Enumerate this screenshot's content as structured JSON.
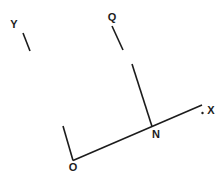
{
  "diagram": {
    "canvas": {
      "width": 223,
      "height": 184,
      "background": "#ffffff"
    },
    "stroke": {
      "color": "#1c1c1c",
      "width": 1.6
    },
    "labels": [
      {
        "name": "label-y",
        "text": "Y",
        "x": 14,
        "y": 24
      },
      {
        "name": "label-q",
        "text": "Q",
        "x": 112,
        "y": 17
      },
      {
        "name": "label-x",
        "text": "X",
        "x": 211,
        "y": 110
      },
      {
        "name": "label-n",
        "text": "N",
        "x": 156,
        "y": 134
      },
      {
        "name": "label-o",
        "text": "O",
        "x": 73,
        "y": 167
      }
    ],
    "segments": [
      {
        "name": "segment-y-tick",
        "x1": 23,
        "y1": 33,
        "x2": 30,
        "y2": 51
      },
      {
        "name": "segment-q-tick",
        "x1": 112,
        "y1": 26,
        "x2": 123,
        "y2": 50
      },
      {
        "name": "segment-q-to-n",
        "x1": 132,
        "y1": 64,
        "x2": 152,
        "y2": 126.5
      },
      {
        "name": "line-o-to-x",
        "x1": 73,
        "y1": 160.5,
        "x2": 202,
        "y2": 105
      },
      {
        "name": "segment-o-toward-y",
        "x1": 73,
        "y1": 160.5,
        "x2": 63,
        "y2": 126
      }
    ],
    "dot": {
      "name": "dot-before-x",
      "x": 202.5,
      "y": 113,
      "r": 1.2
    }
  }
}
